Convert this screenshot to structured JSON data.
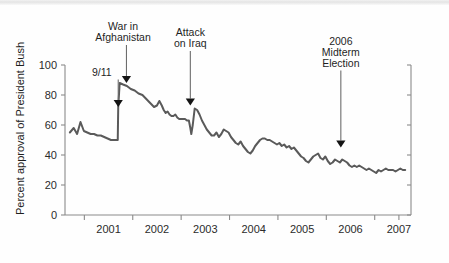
{
  "chart_data": {
    "type": "line",
    "title": "",
    "subtitle": "",
    "xlabel": "",
    "ylabel": "Percent approval of President Bush",
    "xlim": [
      2000.6,
      2007.75
    ],
    "ylim": [
      0,
      100
    ],
    "grid": false,
    "legend": null,
    "legend_position": "none",
    "y_ticks": [
      0,
      20,
      40,
      60,
      80,
      100
    ],
    "y_tick_labels": [
      "0",
      "20",
      "40",
      "60",
      "80",
      "100"
    ],
    "x_tick_labels": [
      "2001",
      "2002",
      "2003",
      "2004",
      "2005",
      "2006",
      "2007"
    ],
    "x_tick_values": [
      2001,
      2002,
      2003,
      2004,
      2005,
      2006,
      2007
    ],
    "series": [
      {
        "name": "Percent approval of President Bush",
        "color": "#5a5a5a",
        "x": [
          2000.7,
          2000.78,
          2000.85,
          2000.92,
          2000.99,
          2001.06,
          2001.13,
          2001.2,
          2001.27,
          2001.34,
          2001.41,
          2001.48,
          2001.55,
          2001.62,
          2001.69,
          2001.7,
          2001.73,
          2001.8,
          2001.88,
          2001.96,
          2002.04,
          2002.12,
          2002.2,
          2002.26,
          2002.32,
          2002.38,
          2002.44,
          2002.5,
          2002.55,
          2002.6,
          2002.64,
          2002.68,
          2002.72,
          2002.76,
          2002.8,
          2002.84,
          2002.88,
          2002.92,
          2002.96,
          2003.0,
          2003.04,
          2003.08,
          2003.12,
          2003.16,
          2003.19,
          2003.21,
          2003.24,
          2003.28,
          2003.33,
          2003.38,
          2003.43,
          2003.48,
          2003.53,
          2003.58,
          2003.63,
          2003.68,
          2003.73,
          2003.78,
          2003.83,
          2003.88,
          2003.93,
          2003.98,
          2004.03,
          2004.08,
          2004.13,
          2004.18,
          2004.23,
          2004.28,
          2004.33,
          2004.38,
          2004.43,
          2004.48,
          2004.53,
          2004.58,
          2004.63,
          2004.68,
          2004.73,
          2004.78,
          2004.83,
          2004.88,
          2004.93,
          2004.98,
          2005.03,
          2005.08,
          2005.13,
          2005.18,
          2005.23,
          2005.28,
          2005.33,
          2005.38,
          2005.43,
          2005.48,
          2005.53,
          2005.58,
          2005.63,
          2005.68,
          2005.73,
          2005.78,
          2005.83,
          2005.88,
          2005.93,
          2005.98,
          2006.03,
          2006.08,
          2006.13,
          2006.18,
          2006.23,
          2006.28,
          2006.33,
          2006.38,
          2006.43,
          2006.48,
          2006.53,
          2006.58,
          2006.63,
          2006.68,
          2006.73,
          2006.78,
          2006.83,
          2006.88,
          2006.93,
          2006.98,
          2007.03,
          2007.08,
          2007.13,
          2007.18,
          2007.23,
          2007.28,
          2007.33,
          2007.38,
          2007.43,
          2007.48,
          2007.53,
          2007.58,
          2007.63
        ],
        "y": [
          55,
          58,
          54,
          62,
          56,
          55,
          54,
          54,
          53,
          53,
          52,
          51,
          50,
          50,
          50,
          72,
          88,
          87,
          86,
          84,
          83,
          81,
          80,
          78,
          76,
          74,
          72,
          73,
          76,
          73,
          70,
          68,
          69,
          67,
          66,
          66,
          67,
          65,
          64,
          64,
          64,
          64,
          63,
          63,
          58,
          54,
          60,
          71,
          70,
          67,
          63,
          60,
          57,
          55,
          53,
          53,
          55,
          52,
          54,
          57,
          56,
          55,
          52,
          50,
          48,
          47,
          49,
          46,
          44,
          42,
          41,
          43,
          46,
          48,
          50,
          51,
          51,
          50,
          50,
          49,
          48,
          47,
          48,
          46,
          47,
          45,
          46,
          44,
          45,
          43,
          41,
          39,
          38,
          36,
          35,
          37,
          39,
          40,
          41,
          38,
          37,
          39,
          36,
          34,
          35,
          37,
          36,
          35,
          37,
          36,
          35,
          33,
          32,
          33,
          32,
          33,
          32,
          31,
          30,
          31,
          30,
          29,
          28,
          30,
          29,
          30,
          31,
          30,
          30,
          30,
          29,
          30,
          31,
          30,
          30
        ]
      }
    ],
    "annotations": [
      {
        "text_lines": [
          "9/11"
        ],
        "x": 2001.7,
        "y": 72,
        "label_x": 2001.36,
        "label_y": 93,
        "arrow": true
      },
      {
        "text_lines": [
          "War in",
          "Afghanistan"
        ],
        "x": 2001.87,
        "y": 88,
        "label_x": 2001.8,
        "label_y": 116,
        "arrow": true
      },
      {
        "text_lines": [
          "Attack",
          "on Iraq"
        ],
        "x": 2003.19,
        "y": 73,
        "label_x": 2003.19,
        "label_y": 112,
        "arrow": true
      },
      {
        "text_lines": [
          "2006",
          "Midterm",
          "Election"
        ],
        "x": 2006.3,
        "y": 45,
        "label_x": 2006.3,
        "label_y": 99,
        "arrow": true
      }
    ]
  },
  "axis": {
    "y_title": "Percent approval of President Bush"
  }
}
